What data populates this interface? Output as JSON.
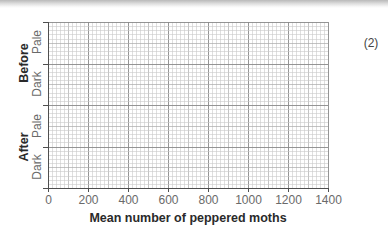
{
  "marks_label": "(2)",
  "colors": {
    "axis": "#4f4f4f",
    "grid_minor": "#c9c9c9",
    "grid_mid": "#a9a9a9",
    "grid_major": "#8a8a8a",
    "text": "#6a6a6a",
    "title_text": "#2a2a2a"
  },
  "chart_data": {
    "type": "bar",
    "orientation": "horizontal",
    "title": "",
    "xlabel": "Mean number of peppered moths",
    "ylabel": "",
    "xlim": [
      0,
      1400
    ],
    "x_ticks": [
      0,
      200,
      400,
      600,
      800,
      1000,
      1200,
      1400
    ],
    "x_tick_labels": [
      "0",
      "200",
      "400",
      "600",
      "800",
      "1000",
      "1200",
      "1400"
    ],
    "groups": [
      {
        "name": "Before",
        "categories": [
          "Pale",
          "Dark"
        ]
      },
      {
        "name": "After",
        "categories": [
          "Pale",
          "Dark"
        ]
      }
    ],
    "categories": [
      "Before Pale",
      "Before Dark",
      "After Pale",
      "After Dark"
    ],
    "values": [
      null,
      null,
      null,
      null
    ],
    "grid": true,
    "grid_style": "graph paper (minor every 20 units, medium every 100, major every 200)",
    "legend": "none",
    "note": "Blank grid for plotting; no bars drawn"
  },
  "y_axis": {
    "group_labels": [
      "Before",
      "After"
    ],
    "category_labels": [
      "Pale",
      "Dark",
      "Pale",
      "Dark"
    ]
  }
}
